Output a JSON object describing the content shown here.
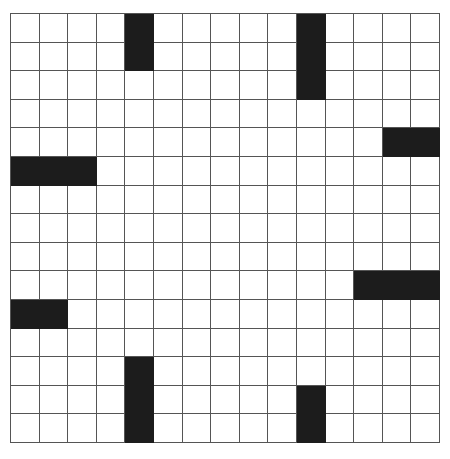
{
  "puzzle": {
    "type": "crossword-grid",
    "rows": 15,
    "cols": 15,
    "symmetry": "rotational-180",
    "colors": {
      "block": "#1c1c1c",
      "open": "#ffffff",
      "line": "#555555"
    },
    "blocks": [
      [
        0,
        4
      ],
      [
        1,
        4
      ],
      [
        0,
        10
      ],
      [
        1,
        10
      ],
      [
        2,
        10
      ],
      [
        4,
        13
      ],
      [
        4,
        14
      ],
      [
        5,
        0
      ],
      [
        5,
        1
      ],
      [
        5,
        2
      ],
      [
        9,
        12
      ],
      [
        9,
        13
      ],
      [
        9,
        14
      ],
      [
        10,
        0
      ],
      [
        10,
        1
      ],
      [
        12,
        4
      ],
      [
        13,
        4
      ],
      [
        14,
        4
      ],
      [
        13,
        10
      ],
      [
        14,
        10
      ]
    ],
    "block_groups": [
      {
        "orientation": "vertical",
        "col": 4,
        "rows": [
          0,
          1
        ]
      },
      {
        "orientation": "vertical",
        "col": 10,
        "rows": [
          0,
          2
        ]
      },
      {
        "orientation": "horizontal",
        "row": 4,
        "cols": [
          13,
          14
        ]
      },
      {
        "orientation": "horizontal",
        "row": 5,
        "cols": [
          0,
          2
        ]
      },
      {
        "orientation": "horizontal",
        "row": 9,
        "cols": [
          12,
          14
        ]
      },
      {
        "orientation": "horizontal",
        "row": 10,
        "cols": [
          0,
          1
        ]
      },
      {
        "orientation": "vertical",
        "col": 4,
        "rows": [
          12,
          14
        ]
      },
      {
        "orientation": "vertical",
        "col": 10,
        "rows": [
          13,
          14
        ]
      }
    ]
  }
}
